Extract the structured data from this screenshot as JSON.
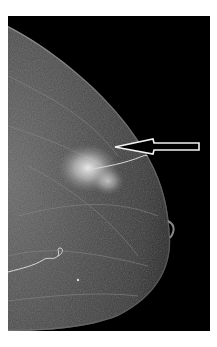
{
  "figure": {
    "caption_fragment": "",
    "annotation": {
      "type": "arrow",
      "points_to": "mass"
    }
  }
}
